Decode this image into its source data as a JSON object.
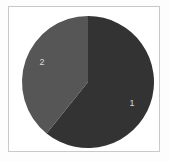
{
  "figure": {
    "background_color": "#fdfdfd",
    "frame_color": "#c9c9c9",
    "plot_background_color": "#ffffff"
  },
  "chart_data": {
    "type": "pie",
    "title": "",
    "xlabel": "",
    "ylabel": "",
    "grid": false,
    "legend": "none",
    "start_angle_deg": 0,
    "direction": "clockwise",
    "categories": [
      "1",
      "2"
    ],
    "values": [
      60.8,
      39.2
    ],
    "value_unit": "percent",
    "labels_inside_slices": true,
    "slices": [
      {
        "label": "1",
        "value": 60.8,
        "angle_deg": 219,
        "color": "#333333",
        "label_color": "#d8d8d8",
        "label_x": 132,
        "label_y": 104
      },
      {
        "label": "2",
        "value": 39.2,
        "angle_deg": 141,
        "color": "#565656",
        "label_color": "#d8d8d8",
        "label_x": 42,
        "label_y": 63
      }
    ],
    "geometry": {
      "center_x": 88,
      "center_y": 82,
      "radius": 66
    }
  }
}
